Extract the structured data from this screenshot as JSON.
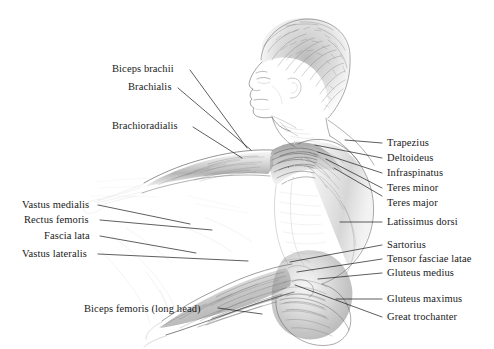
{
  "figure": {
    "type": "anatomical-pencil-sketch",
    "background_color": "#ffffff",
    "ink_color": "#1a1a1a",
    "pencil_color": "#5a5a5a"
  },
  "labels": {
    "left_upper": [
      {
        "text": "Biceps brachii",
        "x": 112,
        "y": 65,
        "anchor": "left"
      },
      {
        "text": "Brachialis",
        "x": 128,
        "y": 83,
        "anchor": "left"
      },
      {
        "text": "Brachioradialis",
        "x": 112,
        "y": 122,
        "anchor": "left"
      }
    ],
    "left_lower": [
      {
        "text": "Vastus medialis",
        "x": 22,
        "y": 201,
        "anchor": "left"
      },
      {
        "text": "Rectus femoris",
        "x": 24,
        "y": 216,
        "anchor": "left"
      },
      {
        "text": "Fascia lata",
        "x": 44,
        "y": 232,
        "anchor": "left"
      },
      {
        "text": "Vastus lateralis",
        "x": 22,
        "y": 250,
        "anchor": "left"
      },
      {
        "text": "Biceps femoris (long head)",
        "x": 84,
        "y": 305,
        "anchor": "left"
      }
    ],
    "right": [
      {
        "text": "Trapezius",
        "x": 387,
        "y": 139
      },
      {
        "text": "Deltoideus",
        "x": 387,
        "y": 154
      },
      {
        "text": "Infraspinatus",
        "x": 387,
        "y": 169
      },
      {
        "text": "Teres minor",
        "x": 387,
        "y": 184
      },
      {
        "text": "Teres major",
        "x": 387,
        "y": 199
      },
      {
        "text": "Latissimus dorsi",
        "x": 387,
        "y": 218
      },
      {
        "text": "Sartorius",
        "x": 387,
        "y": 241
      },
      {
        "text": "Tensor fasciae latae",
        "x": 387,
        "y": 255
      },
      {
        "text": "Gluteus medius",
        "x": 387,
        "y": 269
      },
      {
        "text": "Gluteus maximus",
        "x": 387,
        "y": 295
      },
      {
        "text": "Great trochanter",
        "x": 387,
        "y": 313
      }
    ]
  },
  "leaders": {
    "left_upper": [
      {
        "name": "biceps-brachii",
        "x1": 190,
        "y1": 70,
        "x2": 247,
        "y2": 148
      },
      {
        "name": "brachialis",
        "x1": 178,
        "y1": 88,
        "x2": 251,
        "y2": 150
      },
      {
        "name": "brachioradialis",
        "x1": 193,
        "y1": 127,
        "x2": 242,
        "y2": 158
      }
    ],
    "left_lower": [
      {
        "name": "vastus-medialis",
        "x1": 98,
        "y1": 205,
        "x2": 190,
        "y2": 224
      },
      {
        "name": "rectus-femoris",
        "x1": 100,
        "y1": 220,
        "x2": 212,
        "y2": 230
      },
      {
        "name": "fascia-lata",
        "x1": 100,
        "y1": 236,
        "x2": 196,
        "y2": 253
      },
      {
        "name": "vastus-lateralis",
        "x1": 98,
        "y1": 254,
        "x2": 248,
        "y2": 261
      },
      {
        "name": "biceps-femoris",
        "x1": 218,
        "y1": 308,
        "x2": 262,
        "y2": 314
      }
    ],
    "right": [
      {
        "name": "trapezius",
        "x1": 382,
        "y1": 143,
        "x2": 345,
        "y2": 140
      },
      {
        "name": "deltoideus",
        "x1": 382,
        "y1": 158,
        "x2": 315,
        "y2": 145
      },
      {
        "name": "infraspinatus",
        "x1": 382,
        "y1": 173,
        "x2": 318,
        "y2": 152
      },
      {
        "name": "teres-minor",
        "x1": 382,
        "y1": 188,
        "x2": 326,
        "y2": 159
      },
      {
        "name": "teres-major",
        "x1": 382,
        "y1": 196,
        "x2": 334,
        "y2": 168
      },
      {
        "name": "latissimus-dorsi",
        "x1": 382,
        "y1": 222,
        "x2": 340,
        "y2": 222
      },
      {
        "name": "sartorius",
        "x1": 382,
        "y1": 245,
        "x2": 290,
        "y2": 262
      },
      {
        "name": "tensor-fasciae-latae",
        "x1": 382,
        "y1": 259,
        "x2": 297,
        "y2": 272
      },
      {
        "name": "gluteus-medius",
        "x1": 382,
        "y1": 273,
        "x2": 318,
        "y2": 279
      },
      {
        "name": "gluteus-maximus",
        "x1": 382,
        "y1": 299,
        "x2": 336,
        "y2": 299
      },
      {
        "name": "great-trochanter",
        "x1": 382,
        "y1": 317,
        "x2": 295,
        "y2": 285
      }
    ]
  }
}
